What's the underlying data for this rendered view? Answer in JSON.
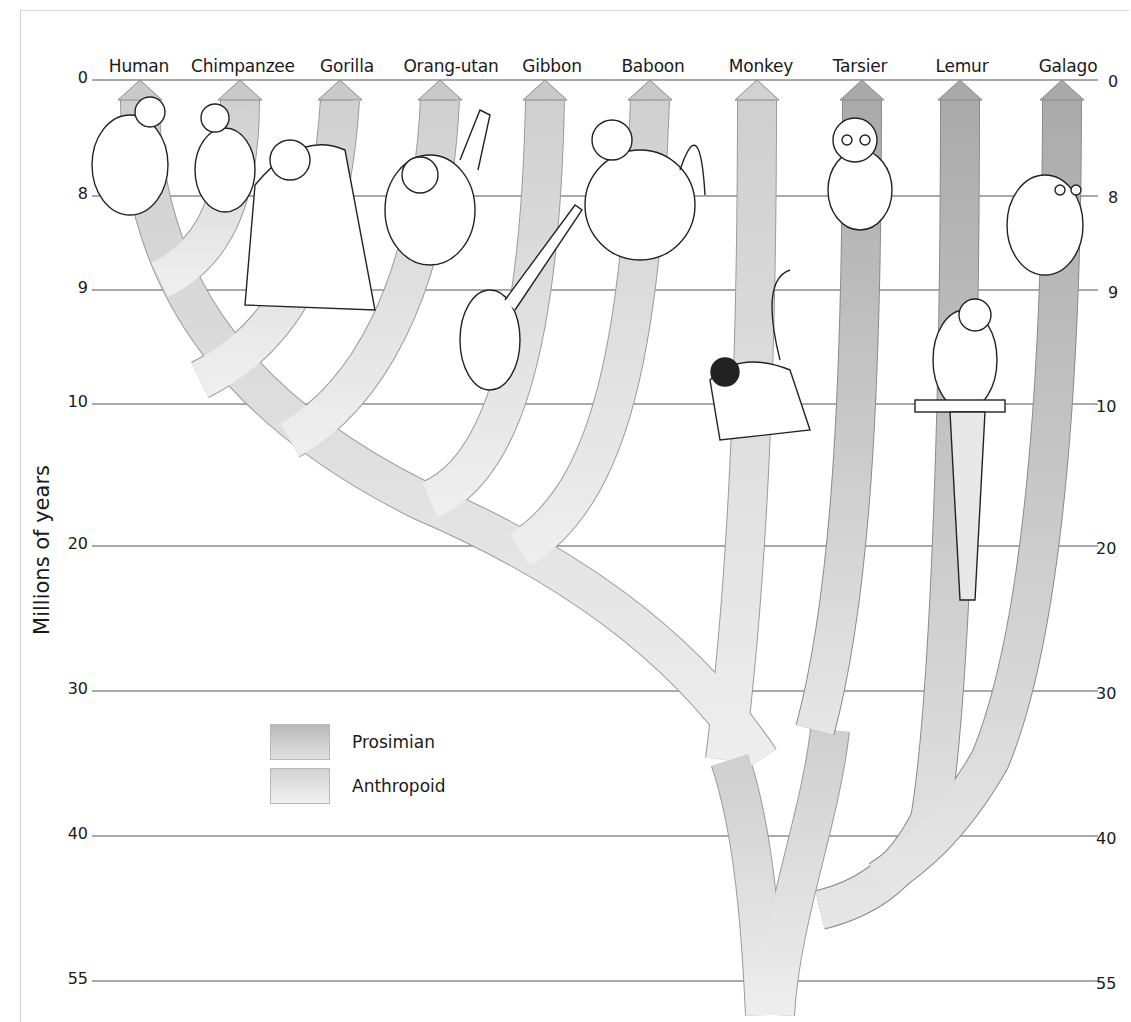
{
  "diagram": {
    "type": "phylogenetic-tree",
    "title": "",
    "y_axis": {
      "title": "Millions of years",
      "ticks_left": [
        "0",
        "8",
        "9",
        "10",
        "20",
        "30",
        "40",
        "55"
      ],
      "ticks_right": [
        "0",
        "8",
        "9",
        "10",
        "20",
        "30",
        "40",
        "55"
      ]
    },
    "species": [
      {
        "name": "Human",
        "group": "Anthropoid"
      },
      {
        "name": "Chimpanzee",
        "group": "Anthropoid"
      },
      {
        "name": "Gorilla",
        "group": "Anthropoid"
      },
      {
        "name": "Orang-utan",
        "group": "Anthropoid"
      },
      {
        "name": "Gibbon",
        "group": "Anthropoid"
      },
      {
        "name": "Baboon",
        "group": "Anthropoid"
      },
      {
        "name": "Monkey",
        "group": "Anthropoid"
      },
      {
        "name": "Tarsier",
        "group": "Prosimian"
      },
      {
        "name": "Lemur",
        "group": "Prosimian"
      },
      {
        "name": "Galago",
        "group": "Prosimian"
      }
    ],
    "legend": [
      {
        "label": "Prosimian",
        "color": "#b9b9b9"
      },
      {
        "label": "Anthropoid",
        "color": "#dcdcdc"
      }
    ],
    "colors": {
      "prosimian": "#b5b5b5",
      "anthropoid": "#d6d6d6",
      "outline": "#8a8a8a",
      "gridline": "#555555"
    }
  }
}
